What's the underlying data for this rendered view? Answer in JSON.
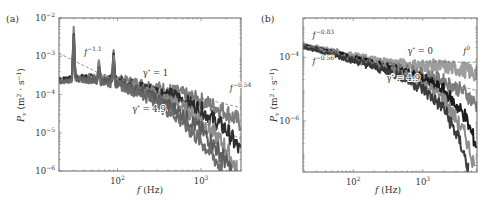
{
  "figure": {
    "panels": [
      {
        "id": "a",
        "label": "(a)",
        "xlabel": "f (Hz)",
        "ylabel": "P_v (m^2 · s^-1)"
      },
      {
        "id": "b",
        "label": "(b)",
        "xlabel": "f (Hz)",
        "ylabel": "P_v (m^2 · s^-1)"
      }
    ]
  },
  "chart_data": [
    {
      "type": "line",
      "panel": "(a)",
      "title": "",
      "xlabel": "f (Hz)",
      "ylabel": "P_v (m^2 · s^-1)",
      "xscale": "log",
      "yscale": "log",
      "xlim": [
        20,
        3000
      ],
      "ylim": [
        1e-06,
        0.01
      ],
      "xticks": [
        {
          "value": 100,
          "label": "10^2"
        },
        {
          "value": 1000,
          "label": "10^3"
        }
      ],
      "yticks": [
        {
          "value": 0.01,
          "label": "10^-2"
        },
        {
          "value": 0.001,
          "label": "10^-3"
        },
        {
          "value": 0.0001,
          "label": "10^-4"
        },
        {
          "value": 1e-05,
          "label": "10^-5"
        },
        {
          "value": 1e-06,
          "label": "10^-6"
        }
      ],
      "annotations": [
        {
          "text": "f^-1.1",
          "x": 40,
          "y": 0.0011
        },
        {
          "text": "γ* = 1",
          "x": 200,
          "y": 0.0003
        },
        {
          "text": "f^-0.54",
          "x": 2200,
          "y": 0.00012
        },
        {
          "text": "γ* = 4.9",
          "x": 150,
          "y": 3.5e-05
        }
      ],
      "fit_lines": [
        {
          "label": "f^-1.1",
          "x": [
            20,
            60
          ],
          "y": [
            0.0012,
            0.00036
          ]
        },
        {
          "label": "f^-0.54",
          "x": [
            60,
            3000
          ],
          "y": [
            0.00036,
            4.5e-05
          ]
        },
        {
          "label": "steep",
          "x": [
            800,
            3000
          ],
          "y": [
            2.4e-05,
            7e-06
          ]
        }
      ],
      "peaks_hz": [
        30,
        60,
        90
      ],
      "series": [
        {
          "name": "γ* = 1",
          "color": "#777777",
          "x": [
            20,
            30,
            50,
            100,
            200,
            500,
            1000,
            2000,
            3000
          ],
          "y": [
            0.00026,
            0.00028,
            0.0003,
            0.00026,
            0.00019,
            0.00012,
            7e-05,
            3.5e-05,
            1.8e-05
          ]
        },
        {
          "name": "γ* = 2",
          "color": "#222222",
          "x": [
            20,
            30,
            50,
            100,
            200,
            500,
            1000,
            2000,
            3000
          ],
          "y": [
            0.00024,
            0.00028,
            0.00028,
            0.00024,
            0.00016,
            9e-05,
            4e-05,
            1.2e-05,
            3e-06
          ]
        },
        {
          "name": "γ* = 3",
          "color": "#888888",
          "x": [
            20,
            30,
            50,
            100,
            200,
            500,
            1000,
            2000,
            2700
          ],
          "y": [
            0.00022,
            0.00026,
            0.00026,
            0.00022,
            0.00014,
            6e-05,
            2.2e-05,
            4e-06,
            1e-06
          ]
        },
        {
          "name": "γ* = 4",
          "color": "#555555",
          "x": [
            20,
            30,
            50,
            100,
            200,
            500,
            1000,
            1800,
            2300
          ],
          "y": [
            0.00021,
            0.00025,
            0.00024,
            0.0002,
            0.00012,
            4e-05,
            1.2e-05,
            2.5e-06,
            1e-06
          ]
        },
        {
          "name": "γ* = 4.9",
          "color": "#666666",
          "x": [
            20,
            30,
            50,
            100,
            200,
            500,
            1000,
            1500,
            1800
          ],
          "y": [
            0.0002,
            0.00024,
            0.00023,
            0.00018,
            0.0001,
            2.8e-05,
            6e-06,
            2e-06,
            1e-06
          ]
        }
      ]
    },
    {
      "type": "line",
      "panel": "(b)",
      "title": "",
      "xlabel": "f (Hz)",
      "ylabel": "P_v (m^2 · s^-1)",
      "xscale": "log",
      "yscale": "log",
      "xlim": [
        19,
        6000
      ],
      "ylim": [
        2.5e-08,
        0.0017
      ],
      "xticks": [
        {
          "value": 100,
          "label": "10^2"
        },
        {
          "value": 1000,
          "label": "10^3"
        }
      ],
      "yticks": [
        {
          "value": 0.0001,
          "label": "10^-4"
        },
        {
          "value": 1e-06,
          "label": "10^-6"
        }
      ],
      "annotations": [
        {
          "text": "f^-0.83",
          "x": 26,
          "y": 0.0004
        },
        {
          "text": "f^-0.56",
          "x": 26,
          "y": 6e-05
        },
        {
          "text": "γ* = 0",
          "x": 600,
          "y": 0.00013
        },
        {
          "text": "f^0",
          "x": 3800,
          "y": 0.00013
        },
        {
          "text": "γ* = 4.9",
          "x": 300,
          "y": 1.8e-05
        }
      ],
      "fit_lines": [
        {
          "label": "f^0",
          "x": [
            1000,
            6000
          ],
          "y": [
            7e-05,
            7e-05
          ]
        },
        {
          "label": "f^-0.56",
          "x": [
            19,
            6000
          ],
          "y": [
            0.00024,
            9e-06
          ]
        }
      ],
      "series": [
        {
          "name": "γ* = 0",
          "color": "#999999",
          "x": [
            19,
            50,
            100,
            200,
            500,
            1000,
            2000,
            4000,
            6000
          ],
          "y": [
            0.00025,
            0.00016,
            0.00011,
            8e-05,
            6e-05,
            5.5e-05,
            5e-05,
            4e-05,
            3e-05
          ]
        },
        {
          "name": "γ* = 1",
          "color": "#777777",
          "x": [
            19,
            50,
            100,
            200,
            500,
            1000,
            2000,
            4000,
            6000
          ],
          "y": [
            0.00024,
            0.00015,
            0.0001,
            7e-05,
            4.5e-05,
            3e-05,
            1.8e-05,
            8e-06,
            3e-06
          ]
        },
        {
          "name": "γ* = 2",
          "color": "#111111",
          "x": [
            19,
            50,
            100,
            200,
            500,
            1000,
            2000,
            4000,
            6000
          ],
          "y": [
            0.00023,
            0.00014,
            9e-05,
            6e-05,
            3.5e-05,
            2e-05,
            9e-06,
            1.5e-06,
            1.5e-07
          ]
        },
        {
          "name": "γ* = 3",
          "color": "#888888",
          "x": [
            19,
            50,
            100,
            200,
            500,
            1000,
            2000,
            4000,
            5500
          ],
          "y": [
            0.00022,
            0.00013,
            8.5e-05,
            5.5e-05,
            3e-05,
            1.5e-05,
            5e-06,
            4e-07,
            4e-08
          ]
        },
        {
          "name": "γ* = 4.9",
          "color": "#333333",
          "x": [
            19,
            50,
            100,
            200,
            500,
            1000,
            2000,
            3500,
            4500
          ],
          "y": [
            0.00021,
            0.00012,
            8e-05,
            5e-05,
            2.5e-05,
            1e-05,
            2.5e-06,
            2e-07,
            3e-08
          ]
        }
      ]
    }
  ]
}
